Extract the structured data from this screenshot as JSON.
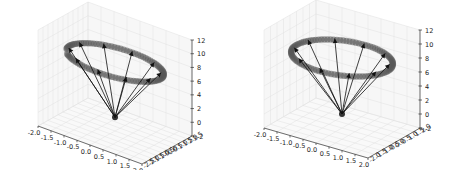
{
  "chart_data": [
    {
      "type": "scatter",
      "subtype": "3d-quiver",
      "title": "",
      "xlabel": "",
      "ylabel": "",
      "zlabel": "",
      "xlim": [
        -2.0,
        2.0
      ],
      "ylim": [
        -2.5,
        2.5
      ],
      "zlim": [
        -2,
        12
      ],
      "x_ticks": [
        "-2.0",
        "-1.5",
        "-1.0",
        "-0.5",
        "0.0",
        "0.5",
        "1.0",
        "1.5",
        "2.0"
      ],
      "y_ticks": [
        "-2.5",
        "-2.0",
        "-1.5",
        "-1.0",
        "-0.5",
        "0.0",
        "0.5",
        "1.0",
        "1.5",
        "2.0",
        "2.5"
      ],
      "z_ticks": [
        "-2",
        "0",
        "2",
        "4",
        "6",
        "8",
        "10",
        "12"
      ],
      "grid": true,
      "apex": {
        "x": 0,
        "y": 0,
        "z": 0
      },
      "ring": {
        "center_z": 8,
        "radius": 1.75,
        "markers": 100,
        "gap": "front-left"
      },
      "arrows": 10,
      "colors": {
        "ring": "#555555",
        "arrows": "#111111",
        "pane": "#f2f2f2",
        "grid": "#e0e0e0"
      }
    },
    {
      "type": "scatter",
      "subtype": "3d-quiver",
      "title": "",
      "xlabel": "",
      "ylabel": "",
      "zlabel": "",
      "xlim": [
        -2.0,
        2.0
      ],
      "ylim": [
        -2.0,
        2.0
      ],
      "zlim": [
        -2,
        12
      ],
      "x_ticks": [
        "-2.0",
        "-1.5",
        "-1.0",
        "-0.5",
        "0.0",
        "0.5",
        "1.0",
        "1.5",
        "2.0"
      ],
      "y_ticks": [
        "-2.0",
        "-1.5",
        "-1.0",
        "-0.5",
        "0.0",
        "0.5",
        "1.0",
        "1.5",
        "2.0"
      ],
      "z_ticks": [
        "-2",
        "0",
        "2",
        "4",
        "6",
        "8",
        "10",
        "12"
      ],
      "grid": true,
      "apex": {
        "x": 0,
        "y": 0,
        "z": 0
      },
      "ring": {
        "center_z": 8,
        "radius": 1.75,
        "markers": 100,
        "gap": "none"
      },
      "arrows": 10,
      "colors": {
        "ring": "#555555",
        "arrows": "#111111",
        "pane": "#f2f2f2",
        "grid": "#e0e0e0"
      }
    }
  ]
}
